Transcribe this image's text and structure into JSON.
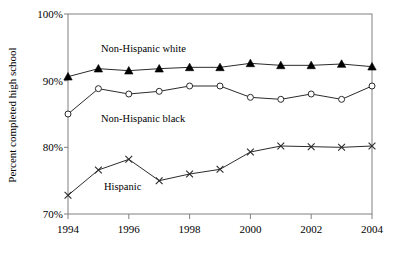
{
  "chart_data": {
    "type": "line",
    "title": "",
    "subtitle": "",
    "xlabel": "",
    "ylabel": "Percent completed high school",
    "x": [
      1994,
      1995,
      1996,
      1997,
      1998,
      1999,
      2000,
      2001,
      2002,
      2003,
      2004
    ],
    "xtick_labels": [
      "1994",
      "1996",
      "1998",
      "2000",
      "2002",
      "2004"
    ],
    "xtick_values": [
      1994,
      1996,
      1998,
      2000,
      2002,
      2004
    ],
    "xlim": [
      1994,
      2004
    ],
    "ytick_labels": [
      "70%",
      "80%",
      "90%",
      "100%"
    ],
    "ytick_values": [
      70,
      80,
      90,
      100
    ],
    "ylim": [
      70,
      100
    ],
    "grid": false,
    "legend_position": "inline-annotations",
    "series": [
      {
        "name": "Non-Hispanic white",
        "marker": "triangle",
        "color": "#000000",
        "values": [
          90.6,
          91.8,
          91.5,
          91.8,
          92.0,
          92.0,
          92.6,
          92.3,
          92.3,
          92.5,
          92.1
        ],
        "label_x": 1995.0,
        "label_y": 94.5
      },
      {
        "name": "Non-Hispanic black",
        "marker": "circle",
        "color": "#2b2b2b",
        "values": [
          85.0,
          88.8,
          88.0,
          88.4,
          89.2,
          89.2,
          87.5,
          87.2,
          88.0,
          87.2,
          89.2
        ],
        "label_x": 1995.0,
        "label_y": 84.6
      },
      {
        "name": "Hispanic",
        "marker": "cross",
        "color": "#2b2b2b",
        "values": [
          72.8,
          76.6,
          78.2,
          75.0,
          76.0,
          76.7,
          79.3,
          80.2,
          80.1,
          80.0,
          80.2
        ],
        "label_x": 1995.1,
        "label_y": 73.7
      }
    ]
  },
  "axes": {
    "y_axis_title": "Percent completed high school",
    "y_ticks": [
      "100%",
      "90%",
      "80%",
      "70%"
    ],
    "x_ticks": [
      "1994",
      "1996",
      "1998",
      "2000",
      "2002",
      "2004"
    ]
  },
  "annotations": {
    "white_label": "Non-Hispanic white",
    "black_label": "Non-Hispanic black",
    "hispanic_label": "Hispanic"
  }
}
